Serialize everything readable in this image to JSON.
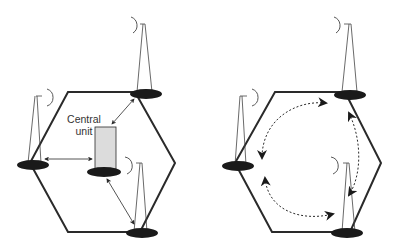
{
  "diagram": {
    "left_panel": {
      "description": "Centralized architecture: base stations linked to a central unit",
      "central_unit_label_line1": "Central",
      "central_unit_label_line2": "unit",
      "base_stations": 4,
      "link_style": "solid double-headed arrows"
    },
    "right_panel": {
      "description": "Distributed architecture: base stations linked to each other",
      "base_stations": 4,
      "link_style": "dotted curved arrows"
    },
    "colors": {
      "line": "#2a2a2a",
      "central_unit_fill": "#dcdcdc",
      "base_fill": "#1a1a1a"
    }
  }
}
